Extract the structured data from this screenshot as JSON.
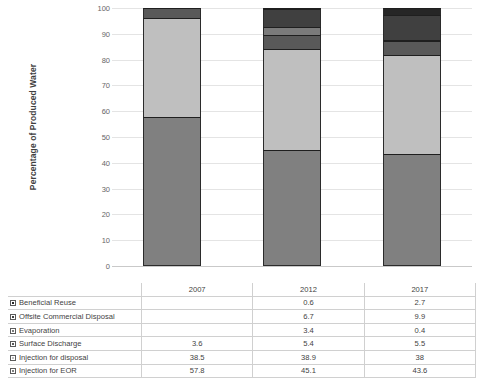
{
  "chart_data": {
    "type": "bar",
    "subtype": "stacked-column-100",
    "title": "",
    "xlabel": "",
    "ylabel": "Percentage of Produced Water",
    "categories": [
      "2007",
      "2012",
      "2017"
    ],
    "ylim": [
      0,
      100
    ],
    "yticks": [
      0,
      10,
      20,
      30,
      40,
      50,
      60,
      70,
      80,
      90,
      100
    ],
    "ytick_labels": [
      "0",
      "10",
      "20",
      "30",
      "40",
      "50",
      "60",
      "70",
      "80",
      "90",
      "100"
    ],
    "grid": true,
    "legend_position": "data-table",
    "stack_order_bottom_to_top": [
      "Injection for EOR",
      "Injection for disposal",
      "Surface Discharge",
      "Evaporation",
      "Offsite Commercial Disposal",
      "Beneficial Reuse"
    ],
    "series": [
      {
        "name": "Beneficial Reuse",
        "values": [
          null,
          0.6,
          2.7
        ],
        "labels": [
          "",
          "0.6",
          "2.7"
        ],
        "color": "#262626"
      },
      {
        "name": "Offsite Commercial Disposal",
        "values": [
          null,
          6.7,
          9.9
        ],
        "labels": [
          "",
          "6.7",
          "9.9"
        ],
        "color": "#404040"
      },
      {
        "name": "Evaporation",
        "values": [
          null,
          3.4,
          0.4
        ],
        "labels": [
          "",
          "3.4",
          "0.4"
        ],
        "color": "#7b7b7b"
      },
      {
        "name": "Surface Discharge",
        "values": [
          3.6,
          5.4,
          5.5
        ],
        "labels": [
          "3.6",
          "5.4",
          "5.5"
        ],
        "color": "#595959"
      },
      {
        "name": "Injection for disposal",
        "values": [
          38.5,
          38.9,
          38.0
        ],
        "labels": [
          "38.5",
          "38.9",
          "38"
        ],
        "color": "#bfbfbf"
      },
      {
        "name": "Injection for EOR",
        "values": [
          57.8,
          45.1,
          43.6
        ],
        "labels": [
          "57.8",
          "45.1",
          "43.6"
        ],
        "color": "#808080"
      }
    ]
  },
  "table": {
    "header_blank": "",
    "columns": [
      "2007",
      "2012",
      "2017"
    ],
    "rows": [
      {
        "label": "Beneficial Reuse",
        "swatch": "#262626",
        "cells": [
          "",
          "0.6",
          "2.7"
        ]
      },
      {
        "label": "Offsite Commercial Disposal",
        "swatch": "#404040",
        "cells": [
          "",
          "6.7",
          "9.9"
        ]
      },
      {
        "label": "Evaporation",
        "swatch": "#7b7b7b",
        "cells": [
          "",
          "3.4",
          "0.4"
        ]
      },
      {
        "label": "Surface Discharge",
        "swatch": "#595959",
        "cells": [
          "3.6",
          "5.4",
          "5.5"
        ]
      },
      {
        "label": "Injection for disposal",
        "swatch": "#bfbfbf",
        "cells": [
          "38.5",
          "38.9",
          "38"
        ]
      },
      {
        "label": "Injection for EOR",
        "swatch": "#808080",
        "cells": [
          "57.8",
          "45.1",
          "43.6"
        ]
      }
    ]
  }
}
